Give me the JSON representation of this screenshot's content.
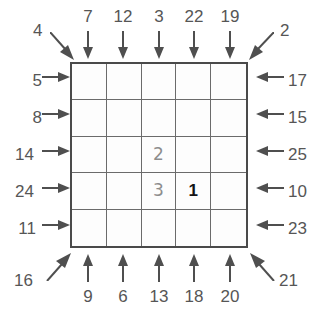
{
  "puzzle": {
    "type": "skyscrapers-grid-puzzle",
    "grid_size": 5,
    "clues": {
      "top": [
        "7",
        "12",
        "3",
        "22",
        "19"
      ],
      "bottom": [
        "9",
        "6",
        "13",
        "18",
        "20"
      ],
      "left": [
        "5",
        "8",
        "14",
        "24",
        "11"
      ],
      "right": [
        "17",
        "15",
        "25",
        "10",
        "23"
      ],
      "corners": {
        "top_left": "4",
        "top_right": "2",
        "bottom_left": "16",
        "bottom_right": "21"
      }
    },
    "cells": [
      {
        "row": 1,
        "col": 1,
        "value": "",
        "style": "empty"
      },
      {
        "row": 1,
        "col": 2,
        "value": "",
        "style": "empty"
      },
      {
        "row": 1,
        "col": 3,
        "value": "",
        "style": "empty"
      },
      {
        "row": 1,
        "col": 4,
        "value": "",
        "style": "empty"
      },
      {
        "row": 1,
        "col": 5,
        "value": "",
        "style": "empty"
      },
      {
        "row": 2,
        "col": 1,
        "value": "",
        "style": "empty"
      },
      {
        "row": 2,
        "col": 2,
        "value": "",
        "style": "empty"
      },
      {
        "row": 2,
        "col": 3,
        "value": "",
        "style": "empty"
      },
      {
        "row": 2,
        "col": 4,
        "value": "",
        "style": "empty"
      },
      {
        "row": 2,
        "col": 5,
        "value": "",
        "style": "empty"
      },
      {
        "row": 3,
        "col": 1,
        "value": "",
        "style": "empty"
      },
      {
        "row": 3,
        "col": 2,
        "value": "",
        "style": "empty"
      },
      {
        "row": 3,
        "col": 3,
        "value": "2",
        "style": "given"
      },
      {
        "row": 3,
        "col": 4,
        "value": "",
        "style": "empty"
      },
      {
        "row": 3,
        "col": 5,
        "value": "",
        "style": "empty"
      },
      {
        "row": 4,
        "col": 1,
        "value": "",
        "style": "empty"
      },
      {
        "row": 4,
        "col": 2,
        "value": "",
        "style": "empty"
      },
      {
        "row": 4,
        "col": 3,
        "value": "3",
        "style": "given"
      },
      {
        "row": 4,
        "col": 4,
        "value": "1",
        "style": "solved"
      },
      {
        "row": 4,
        "col": 5,
        "value": "",
        "style": "empty"
      },
      {
        "row": 5,
        "col": 1,
        "value": "",
        "style": "empty"
      },
      {
        "row": 5,
        "col": 2,
        "value": "",
        "style": "empty"
      },
      {
        "row": 5,
        "col": 3,
        "value": "",
        "style": "empty"
      },
      {
        "row": 5,
        "col": 4,
        "value": "",
        "style": "empty"
      },
      {
        "row": 5,
        "col": 5,
        "value": "",
        "style": "empty"
      }
    ],
    "colors": {
      "clue_text": "#565656",
      "grid_border": "#4a4a4a",
      "grid_line": "#6b6b6b",
      "given_value": "#8d8d8d",
      "solved_value": "#141414",
      "arrow": "#4f4f4f",
      "background": "#ffffff"
    }
  }
}
